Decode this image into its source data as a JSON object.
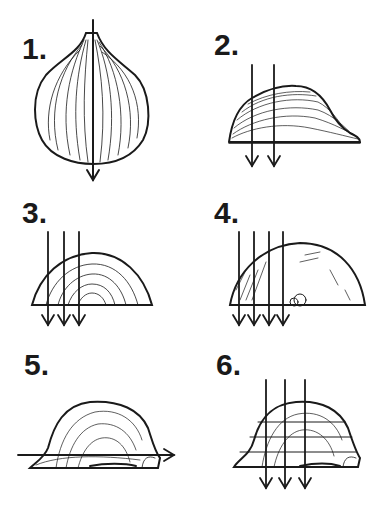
{
  "steps": [
    {
      "number": "1.",
      "description": "Whole onion cut in half from top to root"
    },
    {
      "number": "2.",
      "description": "Half onion flat side down, vertical cuts"
    },
    {
      "number": "3.",
      "description": "Cross-section view, three vertical cuts"
    },
    {
      "number": "4.",
      "description": "Cross-section view, four vertical cuts near root"
    },
    {
      "number": "5.",
      "description": "Horizontal cut through half onion toward root"
    },
    {
      "number": "6.",
      "description": "Vertical cuts across horizontal layers to dice"
    }
  ],
  "colors": {
    "ink": "#1a1a1a",
    "background": "#ffffff"
  }
}
